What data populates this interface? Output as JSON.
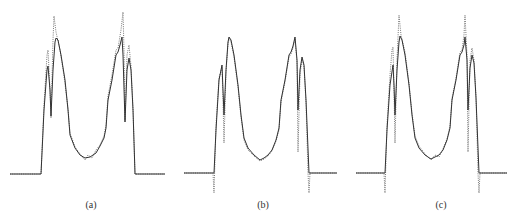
{
  "figure": {
    "panels": [
      {
        "id": "a",
        "label": "(a)",
        "label_x": 91,
        "label_y": 200
      },
      {
        "id": "b",
        "label": "(b)",
        "label_x": 263,
        "label_y": 200
      },
      {
        "id": "c",
        "label": "(c)",
        "label_x": 441,
        "label_y": 200
      }
    ],
    "legend": {
      "solid": "solid line profile",
      "dotted": "dotted line profile"
    },
    "colors": {
      "solid": "#333333",
      "dotted": "#777777",
      "background": "#ffffff"
    }
  },
  "chart_data": [
    {
      "type": "line",
      "title": "(a)",
      "xlabel": "",
      "ylabel": "",
      "grid": false,
      "series": [
        {
          "name": "solid",
          "style": "solid",
          "points": [
            [
              10,
              174
            ],
            [
              41,
              174
            ],
            [
              44,
              110
            ],
            [
              47,
              70
            ],
            [
              48,
              66
            ],
            [
              50,
              90
            ],
            [
              51,
              116
            ],
            [
              53,
              70
            ],
            [
              55,
              42
            ],
            [
              56,
              38
            ],
            [
              58,
              40
            ],
            [
              61,
              55
            ],
            [
              65,
              80
            ],
            [
              68,
              110
            ],
            [
              70,
              135
            ],
            [
              75,
              148
            ],
            [
              80,
              155
            ],
            [
              85,
              158
            ],
            [
              90,
              157
            ],
            [
              93,
              155
            ],
            [
              96,
              153
            ],
            [
              100,
              146
            ],
            [
              104,
              138
            ],
            [
              106,
              128
            ],
            [
              108,
              100
            ],
            [
              112,
              80
            ],
            [
              116,
              55
            ],
            [
              118,
              52
            ],
            [
              120,
              45
            ],
            [
              122,
              37
            ],
            [
              123,
              55
            ],
            [
              125,
              122
            ],
            [
              127,
              70
            ],
            [
              129,
              58
            ],
            [
              131,
              70
            ],
            [
              133,
              110
            ],
            [
              135,
              174
            ],
            [
              165,
              174
            ]
          ]
        },
        {
          "name": "dotted",
          "style": "dotted",
          "points": [
            [
              10,
              174
            ],
            [
              41,
              174
            ],
            [
              44,
              105
            ],
            [
              47,
              55
            ],
            [
              48,
              50
            ],
            [
              50,
              90
            ],
            [
              51,
              118
            ],
            [
              53,
              40
            ],
            [
              54,
              16
            ],
            [
              56,
              32
            ],
            [
              60,
              50
            ],
            [
              64,
              76
            ],
            [
              68,
              108
            ],
            [
              70,
              133
            ],
            [
              75,
              147
            ],
            [
              80,
              154
            ],
            [
              85,
              160
            ],
            [
              88,
              155
            ],
            [
              92,
              158
            ],
            [
              96,
              150
            ],
            [
              100,
              145
            ],
            [
              104,
              136
            ],
            [
              106,
              125
            ],
            [
              108,
              96
            ],
            [
              112,
              75
            ],
            [
              116,
              50
            ],
            [
              118,
              48
            ],
            [
              121,
              30
            ],
            [
              123,
              12
            ],
            [
              124,
              50
            ],
            [
              125,
              120
            ],
            [
              127,
              55
            ],
            [
              129,
              45
            ],
            [
              131,
              66
            ],
            [
              133,
              108
            ],
            [
              135,
              174
            ],
            [
              165,
              174
            ]
          ]
        }
      ]
    },
    {
      "type": "line",
      "title": "(b)",
      "xlabel": "",
      "ylabel": "",
      "grid": false,
      "series": [
        {
          "name": "solid",
          "style": "solid",
          "points": [
            [
              184,
              173
            ],
            [
              214,
              173
            ],
            [
              216,
              130
            ],
            [
              219,
              80
            ],
            [
              222,
              65
            ],
            [
              223,
              90
            ],
            [
              224,
              115
            ],
            [
              226,
              70
            ],
            [
              228,
              42
            ],
            [
              229,
              37
            ],
            [
              231,
              40
            ],
            [
              234,
              55
            ],
            [
              238,
              85
            ],
            [
              241,
              115
            ],
            [
              244,
              138
            ],
            [
              248,
              148
            ],
            [
              254,
              155
            ],
            [
              260,
              160
            ],
            [
              264,
              158
            ],
            [
              268,
              155
            ],
            [
              272,
              150
            ],
            [
              276,
              140
            ],
            [
              279,
              128
            ],
            [
              281,
              100
            ],
            [
              285,
              80
            ],
            [
              289,
              55
            ],
            [
              291,
              52
            ],
            [
              293,
              46
            ],
            [
              295,
              37
            ],
            [
              297,
              60
            ],
            [
              298,
              110
            ],
            [
              300,
              70
            ],
            [
              302,
              57
            ],
            [
              304,
              65
            ],
            [
              306,
              100
            ],
            [
              309,
              173
            ],
            [
              337,
              173
            ]
          ]
        },
        {
          "name": "dotted",
          "style": "dotted",
          "points": [
            [
              184,
              173
            ],
            [
              213,
              173
            ],
            [
              214,
              193
            ],
            [
              216,
              125
            ],
            [
              219,
              78
            ],
            [
              222,
              67
            ],
            [
              223,
              100
            ],
            [
              224,
              143
            ],
            [
              226,
              72
            ],
            [
              228,
              44
            ],
            [
              229,
              38
            ],
            [
              231,
              42
            ],
            [
              234,
              57
            ],
            [
              238,
              87
            ],
            [
              241,
              117
            ],
            [
              244,
              140
            ],
            [
              248,
              150
            ],
            [
              254,
              156
            ],
            [
              260,
              161
            ],
            [
              264,
              159
            ],
            [
              268,
              156
            ],
            [
              272,
              151
            ],
            [
              276,
              141
            ],
            [
              279,
              130
            ],
            [
              281,
              102
            ],
            [
              285,
              82
            ],
            [
              289,
              57
            ],
            [
              291,
              54
            ],
            [
              293,
              48
            ],
            [
              295,
              39
            ],
            [
              297,
              62
            ],
            [
              298,
              152
            ],
            [
              300,
              75
            ],
            [
              302,
              59
            ],
            [
              304,
              67
            ],
            [
              306,
              102
            ],
            [
              308,
              173
            ],
            [
              309,
              193
            ],
            [
              310,
              173
            ],
            [
              337,
              173
            ]
          ]
        }
      ]
    },
    {
      "type": "line",
      "title": "(c)",
      "xlabel": "",
      "ylabel": "",
      "grid": false,
      "series": [
        {
          "name": "solid",
          "style": "solid",
          "points": [
            [
              356,
              173
            ],
            [
              385,
              173
            ],
            [
              387,
              130
            ],
            [
              390,
              85
            ],
            [
              393,
              65
            ],
            [
              394,
              85
            ],
            [
              395,
              115
            ],
            [
              397,
              70
            ],
            [
              399,
              42
            ],
            [
              400,
              36
            ],
            [
              402,
              40
            ],
            [
              405,
              55
            ],
            [
              409,
              85
            ],
            [
              412,
              115
            ],
            [
              415,
              138
            ],
            [
              419,
              148
            ],
            [
              425,
              155
            ],
            [
              431,
              159
            ],
            [
              435,
              157
            ],
            [
              439,
              155
            ],
            [
              443,
              150
            ],
            [
              447,
              140
            ],
            [
              450,
              128
            ],
            [
              452,
              100
            ],
            [
              456,
              80
            ],
            [
              460,
              55
            ],
            [
              462,
              52
            ],
            [
              464,
              45
            ],
            [
              465,
              37
            ],
            [
              467,
              60
            ],
            [
              468,
              110
            ],
            [
              470,
              68
            ],
            [
              472,
              55
            ],
            [
              474,
              63
            ],
            [
              476,
              98
            ],
            [
              479,
              173
            ],
            [
              507,
              173
            ]
          ]
        },
        {
          "name": "dotted",
          "style": "dotted",
          "points": [
            [
              356,
              173
            ],
            [
              384,
              173
            ],
            [
              385,
              193
            ],
            [
              387,
              125
            ],
            [
              390,
              75
            ],
            [
              392,
              50
            ],
            [
              393,
              47
            ],
            [
              394,
              90
            ],
            [
              395,
              143
            ],
            [
              397,
              60
            ],
            [
              399,
              15
            ],
            [
              401,
              35
            ],
            [
              405,
              52
            ],
            [
              409,
              83
            ],
            [
              412,
              113
            ],
            [
              415,
              136
            ],
            [
              419,
              146
            ],
            [
              425,
              154
            ],
            [
              431,
              160
            ],
            [
              435,
              155
            ],
            [
              439,
              157
            ],
            [
              443,
              149
            ],
            [
              447,
              139
            ],
            [
              450,
              126
            ],
            [
              452,
              98
            ],
            [
              456,
              78
            ],
            [
              460,
              52
            ],
            [
              462,
              50
            ],
            [
              464,
              35
            ],
            [
              465,
              15
            ],
            [
              467,
              55
            ],
            [
              468,
              152
            ],
            [
              470,
              60
            ],
            [
              472,
              48
            ],
            [
              474,
              60
            ],
            [
              476,
              96
            ],
            [
              478,
              173
            ],
            [
              479,
              193
            ],
            [
              480,
              173
            ],
            [
              507,
              173
            ]
          ]
        }
      ]
    }
  ]
}
